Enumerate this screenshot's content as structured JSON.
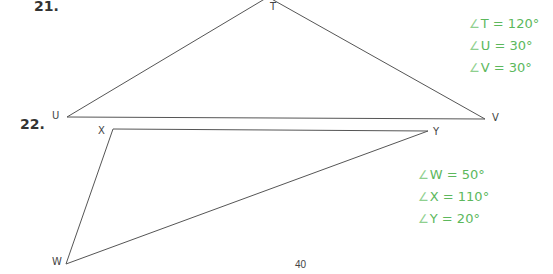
{
  "problems": [
    {
      "number": "21.",
      "triangle": {
        "vertices": [
          {
            "label": "T",
            "x": 268,
            "y": -3
          },
          {
            "label": "U",
            "x": 67,
            "y": 117
          },
          {
            "label": "V",
            "x": 485,
            "y": 119
          }
        ]
      },
      "angles": [
        {
          "symbol": "∠",
          "text": "T = 120°"
        },
        {
          "symbol": "∠",
          "text": "U = 30°"
        },
        {
          "symbol": "∠",
          "text": "V = 30°"
        }
      ]
    },
    {
      "number": "22.",
      "triangle": {
        "vertices": [
          {
            "label": "W",
            "x": 66,
            "y": 264
          },
          {
            "label": "X",
            "x": 113,
            "y": 129
          },
          {
            "label": "Y",
            "x": 428,
            "y": 131
          }
        ]
      },
      "angles": [
        {
          "symbol": "∠",
          "text": "W = 50°"
        },
        {
          "symbol": "∠",
          "text": "X = 110°"
        },
        {
          "symbol": "∠",
          "text": "Y = 20°"
        }
      ]
    }
  ],
  "page_number": "40",
  "colors": {
    "answer_green": "#5cb85c",
    "line": "#555555"
  }
}
